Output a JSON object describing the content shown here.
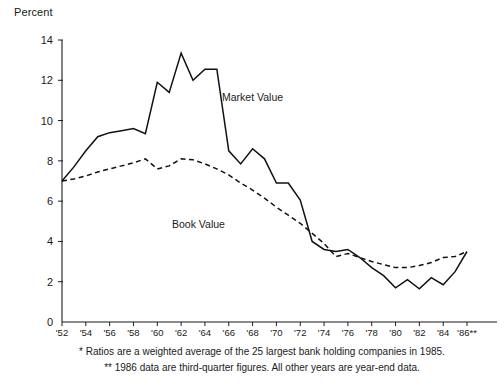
{
  "chart_data": {
    "type": "line",
    "title": "",
    "ylabel": "Percent",
    "xlabel": "",
    "ylim": [
      0,
      14
    ],
    "ytick_values": [
      0,
      2,
      4,
      6,
      8,
      10,
      12,
      14
    ],
    "ytick_labels": [
      "0",
      "2",
      "4",
      "6",
      "8",
      "10",
      "12",
      "14"
    ],
    "grid": false,
    "legend_position": "inline-annotation",
    "xlim": [
      1952,
      1986
    ],
    "xtick_labels": [
      "'52",
      "'54",
      "'56",
      "'58",
      "'60",
      "'62",
      "'64",
      "'66",
      "'68",
      "'70",
      "'72",
      "'74",
      "'76",
      "'78",
      "'80",
      "'82",
      "'84",
      "'86**"
    ],
    "xtick_values": [
      1952,
      1954,
      1956,
      1958,
      1960,
      1962,
      1964,
      1966,
      1968,
      1970,
      1972,
      1974,
      1976,
      1978,
      1980,
      1982,
      1984,
      1986
    ],
    "x": [
      1952,
      1953,
      1954,
      1955,
      1956,
      1957,
      1958,
      1959,
      1960,
      1961,
      1962,
      1963,
      1964,
      1965,
      1966,
      1967,
      1968,
      1969,
      1970,
      1971,
      1972,
      1973,
      1974,
      1975,
      1976,
      1977,
      1978,
      1979,
      1980,
      1981,
      1982,
      1983,
      1984,
      1985,
      1986
    ],
    "series": [
      {
        "name": "Market Value",
        "style": "solid",
        "label_text": "Market Value",
        "values": [
          7.0,
          7.7,
          8.5,
          9.2,
          9.4,
          9.5,
          9.6,
          9.35,
          11.9,
          11.4,
          13.35,
          12.0,
          12.55,
          12.55,
          8.5,
          7.85,
          8.6,
          8.1,
          6.9,
          6.9,
          6.05,
          4.0,
          3.6,
          3.5,
          3.6,
          3.2,
          2.7,
          2.3,
          1.7,
          2.1,
          1.65,
          2.2,
          1.85,
          2.5,
          3.5
        ]
      },
      {
        "name": "Book Value",
        "style": "dashed",
        "label_text": "Book Value",
        "values": [
          7.0,
          7.1,
          7.25,
          7.45,
          7.6,
          7.75,
          7.9,
          8.1,
          7.6,
          7.75,
          8.1,
          8.05,
          7.85,
          7.6,
          7.3,
          6.9,
          6.55,
          6.15,
          5.7,
          5.3,
          4.9,
          4.4,
          3.9,
          3.25,
          3.4,
          3.2,
          3.0,
          2.85,
          2.7,
          2.7,
          2.8,
          2.95,
          3.2,
          3.25,
          3.5
        ]
      }
    ],
    "footnotes": [
      "* Ratios are a weighted average of the 25 largest bank holding companies in 1985.",
      "** 1986 data are third-quarter figures.  All other years are year-end data."
    ]
  }
}
